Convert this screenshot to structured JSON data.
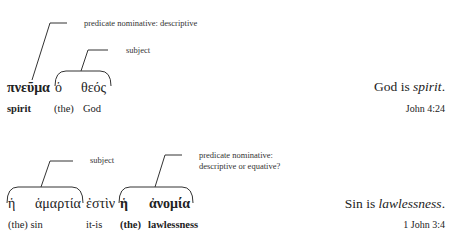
{
  "example1": {
    "annotations": {
      "predicate": "predicate nominative: descriptive",
      "subject": "subject"
    },
    "greek": [
      "πνεῦμα",
      "ὁ",
      "θεός"
    ],
    "gloss": [
      "spirit",
      "(the)",
      "God"
    ],
    "translation": {
      "before": "God is ",
      "italic": "spirit",
      "after": "."
    },
    "reference": "John 4:24"
  },
  "example2": {
    "annotations": {
      "subject": "subject",
      "predicate_line1": "predicate nominative:",
      "predicate_line2": "descriptive or equative?"
    },
    "greek": [
      "ἡ",
      "ἁμαρτία",
      "ἐστὶν",
      "ἡ",
      "ἀνομία"
    ],
    "gloss": [
      "(the) sin",
      "it-is",
      "(the)",
      "lawlessness"
    ],
    "translation": {
      "before": "Sin is ",
      "italic": "lawlessness",
      "after": "."
    },
    "reference": "1 John 3:4"
  }
}
